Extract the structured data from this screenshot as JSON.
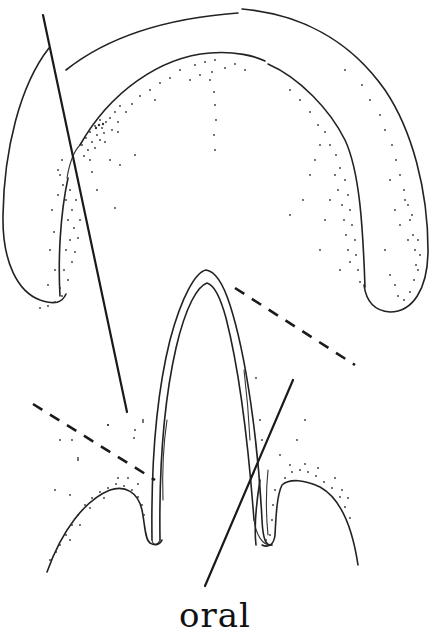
{
  "figure": {
    "label": "oral",
    "colors": {
      "ink": "#222222",
      "background": "#ffffff"
    },
    "elements": {
      "outer_horseshoe": "outer-horseshoe-outline",
      "inner_arch": "inner-arch-outline",
      "central_loop": "central-u-loop",
      "lower_left_flap": "lower-left-flap",
      "lower_right_flap": "lower-right-flap",
      "section_lines_solid": 2,
      "section_lines_dashed": 2
    }
  }
}
